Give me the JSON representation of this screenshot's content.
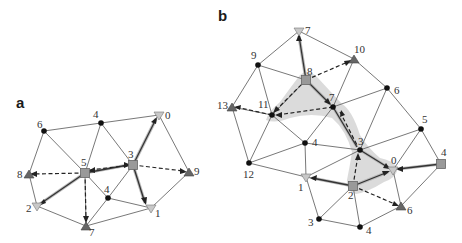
{
  "panels": {
    "a": {
      "label": "a",
      "nodes": [
        {
          "id": "a6",
          "label": "6",
          "type": "dot",
          "x": 44,
          "y": 131
        },
        {
          "id": "a4t",
          "label": "4",
          "type": "dot",
          "x": 101,
          "y": 123
        },
        {
          "id": "a0",
          "label": "0",
          "type": "triangle-down",
          "x": 159,
          "y": 115
        },
        {
          "id": "a5",
          "label": "5",
          "type": "square",
          "x": 85,
          "y": 173
        },
        {
          "id": "a3",
          "label": "3",
          "type": "square",
          "x": 133,
          "y": 165
        },
        {
          "id": "a8",
          "label": "8",
          "type": "triangle-up",
          "x": 29,
          "y": 174
        },
        {
          "id": "a9",
          "label": "9",
          "type": "triangle-up",
          "x": 189,
          "y": 172
        },
        {
          "id": "a4m",
          "label": "4",
          "type": "dot",
          "x": 108,
          "y": 198
        },
        {
          "id": "a2",
          "label": "2",
          "type": "triangle-down",
          "x": 37,
          "y": 206
        },
        {
          "id": "a7",
          "label": "7",
          "type": "triangle-up",
          "x": 86,
          "y": 226
        },
        {
          "id": "a1",
          "label": "1",
          "type": "triangle-down",
          "x": 151,
          "y": 208
        }
      ]
    },
    "b": {
      "label": "b",
      "nodes": [
        {
          "id": "b7t",
          "label": "7",
          "type": "triangle-down",
          "x": 299,
          "y": 31
        },
        {
          "id": "b9",
          "label": "9",
          "type": "dot",
          "x": 258,
          "y": 65
        },
        {
          "id": "b10",
          "label": "10",
          "type": "triangle-up",
          "x": 354,
          "y": 59
        },
        {
          "id": "b8",
          "label": "8",
          "type": "square",
          "x": 306,
          "y": 80
        },
        {
          "id": "b6t",
          "label": "6",
          "type": "dot",
          "x": 387,
          "y": 88
        },
        {
          "id": "b13",
          "label": "13",
          "type": "triangle-up",
          "x": 232,
          "y": 107
        },
        {
          "id": "b11",
          "label": "11",
          "type": "dot",
          "x": 272,
          "y": 115
        },
        {
          "id": "b7m",
          "label": "7",
          "type": "dot",
          "x": 333,
          "y": 107
        },
        {
          "id": "b5",
          "label": "5",
          "type": "dot",
          "x": 421,
          "y": 129
        },
        {
          "id": "b4m",
          "label": "4",
          "type": "dot",
          "x": 305,
          "y": 143
        },
        {
          "id": "b3m",
          "label": "3",
          "type": "dot",
          "x": 360,
          "y": 150
        },
        {
          "id": "b12",
          "label": "12",
          "type": "dot",
          "x": 249,
          "y": 163
        },
        {
          "id": "b4r",
          "label": "4",
          "type": "square",
          "x": 441,
          "y": 164
        },
        {
          "id": "b0",
          "label": "0",
          "type": "triangle-down",
          "x": 393,
          "y": 170
        },
        {
          "id": "b1",
          "label": "1",
          "type": "triangle-down",
          "x": 306,
          "y": 177
        },
        {
          "id": "b2",
          "label": "2",
          "type": "square",
          "x": 353,
          "y": 186
        },
        {
          "id": "b6b",
          "label": "6",
          "type": "triangle-up",
          "x": 401,
          "y": 206
        },
        {
          "id": "b3b",
          "label": "3",
          "type": "dot",
          "x": 319,
          "y": 219
        },
        {
          "id": "b4b",
          "label": "4",
          "type": "dot",
          "x": 360,
          "y": 227
        }
      ]
    }
  },
  "colors": {
    "edge": "#555555",
    "dot": "#111111",
    "square": "#999999",
    "triangle_up": "#666666",
    "triangle_down": "#c8c8c8",
    "shade": "#d5d5d5"
  }
}
